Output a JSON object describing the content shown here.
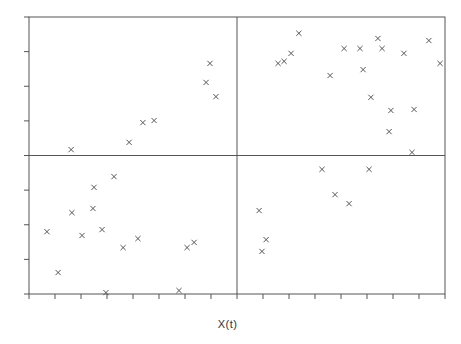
{
  "chart_data": {
    "type": "scatter",
    "title": "",
    "xlabel": "X(t)",
    "ylabel": "",
    "marker": "x",
    "grid": false,
    "legend": null,
    "quadrant_dividers": {
      "x": 0,
      "y": 0
    },
    "xlim": [
      -8,
      8
    ],
    "ylim": [
      -4,
      4
    ],
    "x_ticks": [
      -8,
      -7,
      -6,
      -5,
      -4,
      -3,
      -2,
      -1,
      0,
      1,
      2,
      3,
      4,
      5,
      6,
      7,
      8
    ],
    "y_ticks": [
      -4,
      -3,
      -2,
      -1,
      0,
      1,
      2,
      3,
      4
    ],
    "tick_labels_shown": false,
    "colors": {
      "axis": "#555555",
      "marker": "#444444",
      "background": "#ffffff"
    },
    "points": [
      {
        "x": -6.38,
        "y": 0.17
      },
      {
        "x": -4.15,
        "y": 0.38
      },
      {
        "x": -3.62,
        "y": 0.95
      },
      {
        "x": -3.19,
        "y": 1.01
      },
      {
        "x": -1.19,
        "y": 2.11
      },
      {
        "x": -1.04,
        "y": 2.66
      },
      {
        "x": -0.81,
        "y": 1.7
      },
      {
        "x": 2.38,
        "y": 3.53
      },
      {
        "x": 1.58,
        "y": 2.66
      },
      {
        "x": 1.81,
        "y": 2.72
      },
      {
        "x": 2.08,
        "y": 2.95
      },
      {
        "x": 4.12,
        "y": 3.09
      },
      {
        "x": 4.73,
        "y": 3.09
      },
      {
        "x": 5.42,
        "y": 3.38
      },
      {
        "x": 5.58,
        "y": 3.09
      },
      {
        "x": 6.42,
        "y": 2.95
      },
      {
        "x": 7.38,
        "y": 3.32
      },
      {
        "x": 7.81,
        "y": 2.66
      },
      {
        "x": 3.58,
        "y": 2.31
      },
      {
        "x": 4.85,
        "y": 2.48
      },
      {
        "x": 5.15,
        "y": 1.68
      },
      {
        "x": 5.92,
        "y": 1.3
      },
      {
        "x": 6.81,
        "y": 1.33
      },
      {
        "x": 5.85,
        "y": 0.69
      },
      {
        "x": 6.73,
        "y": 0.09
      },
      {
        "x": -7.31,
        "y": -2.2
      },
      {
        "x": -6.88,
        "y": -3.38
      },
      {
        "x": -6.35,
        "y": -1.65
      },
      {
        "x": -5.5,
        "y": -0.92
      },
      {
        "x": -5.54,
        "y": -1.53
      },
      {
        "x": -5.96,
        "y": -2.31
      },
      {
        "x": -4.73,
        "y": -0.61
      },
      {
        "x": -5.19,
        "y": -2.14
      },
      {
        "x": -5.04,
        "y": -3.96
      },
      {
        "x": -4.38,
        "y": -2.66
      },
      {
        "x": -3.81,
        "y": -2.4
      },
      {
        "x": -2.23,
        "y": -3.9
      },
      {
        "x": -1.92,
        "y": -2.66
      },
      {
        "x": -1.65,
        "y": -2.51
      },
      {
        "x": 3.27,
        "y": -0.4
      },
      {
        "x": 5.08,
        "y": -0.4
      },
      {
        "x": 3.77,
        "y": -1.13
      },
      {
        "x": 4.31,
        "y": -1.39
      },
      {
        "x": 0.85,
        "y": -1.59
      },
      {
        "x": 1.12,
        "y": -2.43
      },
      {
        "x": 0.96,
        "y": -2.77
      }
    ]
  },
  "plot": {
    "frame": {
      "left": 29,
      "top": 17,
      "right": 445,
      "bottom": 294
    }
  }
}
